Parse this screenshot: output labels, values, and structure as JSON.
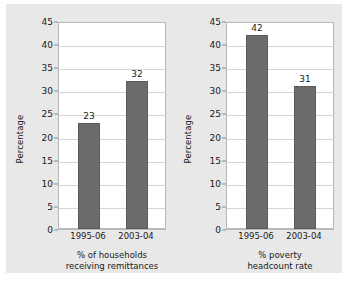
{
  "chart_data": [
    {
      "type": "bar",
      "title": "",
      "xlabel": "% of households receiving remittances",
      "xlabel_lines": [
        "% of households",
        "receiving remittances"
      ],
      "ylabel": "Percentage",
      "categories": [
        "1995-06",
        "2003-04"
      ],
      "values": [
        23,
        32
      ],
      "ylim": [
        0,
        45
      ],
      "yticks": [
        0,
        5,
        10,
        15,
        20,
        25,
        30,
        35,
        40,
        45
      ],
      "grid": "horizontal",
      "legend": "none",
      "bar_color": "#6b6b6b",
      "plot_background": "#ffffff"
    },
    {
      "type": "bar",
      "title": "",
      "xlabel": "% poverty headcount rate",
      "xlabel_lines": [
        "% poverty",
        "headcount rate"
      ],
      "ylabel": "Percentage",
      "categories": [
        "1995-06",
        "2003-04"
      ],
      "values": [
        42,
        31
      ],
      "ylim": [
        0,
        45
      ],
      "yticks": [
        0,
        5,
        10,
        15,
        20,
        25,
        30,
        35,
        40,
        45
      ],
      "grid": "horizontal",
      "legend": "none",
      "bar_color": "#6b6b6b",
      "plot_background": "#ffffff"
    }
  ],
  "figure": {
    "background": "#e8e8e8",
    "outer_background": "#ffffff"
  }
}
